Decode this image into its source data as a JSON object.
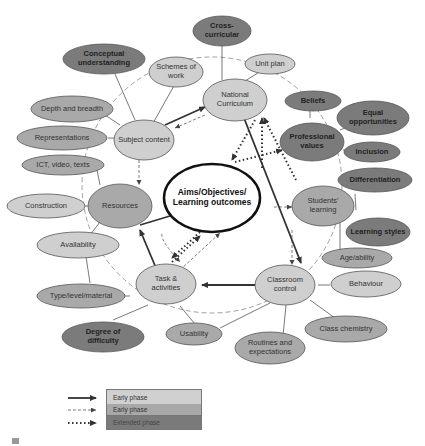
{
  "diagram": {
    "center": {
      "label": "Aims/Objectives/ Learning outcomes"
    },
    "primary_nodes": [
      {
        "id": "national-curriculum",
        "label": "National Curriculum"
      },
      {
        "id": "subject-content",
        "label": "Subject content"
      },
      {
        "id": "resources",
        "label": "Resources"
      },
      {
        "id": "task-activities",
        "label": "Task & activities"
      },
      {
        "id": "classroom-control",
        "label": "Classroom control"
      },
      {
        "id": "students-learning",
        "label": "Students' learning"
      },
      {
        "id": "professional-values",
        "label": "Professional values"
      }
    ],
    "satellite_nodes": [
      {
        "id": "cross-curricular",
        "label": "Cross-curricular",
        "parent": "national-curriculum"
      },
      {
        "id": "unit-plan",
        "label": "Unit plan",
        "parent": "national-curriculum"
      },
      {
        "id": "schemes-of-work",
        "label": "Schemes of work",
        "parent": "subject-content"
      },
      {
        "id": "conceptual-understanding",
        "label": "Conceptual understanding",
        "parent": "subject-content"
      },
      {
        "id": "depth-and-breadth",
        "label": "Depth and breadth",
        "parent": "subject-content"
      },
      {
        "id": "representations",
        "label": "Representations",
        "parent": "subject-content"
      },
      {
        "id": "ict-video-texts",
        "label": "ICT, video, texts",
        "parent": "resources"
      },
      {
        "id": "construction",
        "label": "Construction",
        "parent": "resources"
      },
      {
        "id": "availability",
        "label": "Availability",
        "parent": "resources"
      },
      {
        "id": "type-level-material",
        "label": "Type/level/material",
        "parent": "task-activities"
      },
      {
        "id": "degree-of-difficulty",
        "label": "Degree of difficulty",
        "parent": "task-activities"
      },
      {
        "id": "usability",
        "label": "Usability",
        "parent": "task-activities"
      },
      {
        "id": "routines-and-expectations",
        "label": "Routines and expectations",
        "parent": "classroom-control"
      },
      {
        "id": "class-chemistry",
        "label": "Class chemistry",
        "parent": "classroom-control"
      },
      {
        "id": "behaviour",
        "label": "Behaviour",
        "parent": "classroom-control"
      },
      {
        "id": "age-ability",
        "label": "Age/ability",
        "parent": "students-learning"
      },
      {
        "id": "learning-styles",
        "label": "Learning styles",
        "parent": "students-learning"
      },
      {
        "id": "differentiation",
        "label": "Differentiation",
        "parent": "students-learning"
      },
      {
        "id": "inclusion",
        "label": "Inclusion",
        "parent": "professional-values"
      },
      {
        "id": "equal-opportunities",
        "label": "Equal opportunities",
        "parent": "professional-values"
      },
      {
        "id": "beliefs",
        "label": "Beliefs",
        "parent": "professional-values"
      }
    ]
  },
  "legend": {
    "items": [
      {
        "line": "solid",
        "label": "Early phase",
        "color": "#d0d0d0"
      },
      {
        "line": "dashed",
        "label": "Early phase",
        "color": "#a8a8a8"
      },
      {
        "line": "dotted",
        "label": "Extended phase",
        "color": "#7a7a7a"
      }
    ]
  },
  "colors": {
    "light": "#cfcfcf",
    "medium": "#a9a9a9",
    "dark": "#7b7b7b",
    "stroke": "#555555"
  }
}
